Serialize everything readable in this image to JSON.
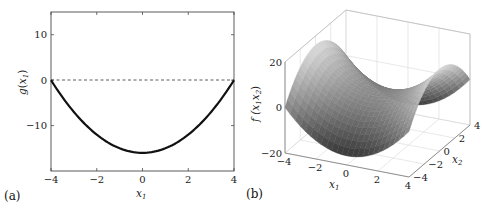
{
  "chart_data": [
    {
      "type": "line",
      "panel_label": "(a)",
      "title": "",
      "xlabel": "x_1",
      "ylabel": "g(x_1)",
      "xlim": [
        -4,
        4
      ],
      "ylim": [
        -20,
        15
      ],
      "xticks": [
        "-4",
        "-2",
        "0",
        "2",
        "4"
      ],
      "yticks": [
        "10",
        "0",
        "-10"
      ],
      "grid": false,
      "series": [
        {
          "name": "g(x1) = x1^2 - 16",
          "style": "solid thick black",
          "x": [
            -4,
            -3,
            -2,
            -1,
            0,
            1,
            2,
            3,
            4
          ],
          "y": [
            0,
            -7,
            -12,
            -15,
            -16,
            -15,
            -12,
            -7,
            0
          ]
        },
        {
          "name": "zero line",
          "style": "dashed",
          "x": [
            -4,
            4
          ],
          "y": [
            0,
            0
          ]
        }
      ]
    },
    {
      "type": "surface",
      "panel_label": "(b)",
      "title": "",
      "xlabel": "x_1",
      "ylabel": "x_2",
      "zlabel": "f(x_1 x_2)",
      "xlim": [
        -4,
        4
      ],
      "ylim": [
        -4,
        4
      ],
      "zlim": [
        -20,
        20
      ],
      "xticks": [
        "-4",
        "-2",
        "0",
        "2",
        "4"
      ],
      "yticks": [
        "-4",
        "-2",
        "0",
        "2",
        "4"
      ],
      "zticks": [
        "20",
        "0",
        "-20"
      ],
      "grid": true,
      "function": "f(x1,x2) = x1^2 - x2^2",
      "colormap": "gray"
    }
  ],
  "labels": {
    "a_panel": "(a)",
    "b_panel": "(b)",
    "a_ylabel_g": "g",
    "a_ylabel_x": "x",
    "a_ylabel_sub": "1",
    "a_xlabel": "x",
    "a_xlabel_sub": "1",
    "b_zlabel": "f (x",
    "b_zlabel_sub1": "1",
    "b_zlabel_x2": "x",
    "b_zlabel_sub2": "2",
    "b_xlabel": "x",
    "b_xlabel_sub": "1",
    "b_ylabel": "x",
    "b_ylabel_sub": "2"
  }
}
